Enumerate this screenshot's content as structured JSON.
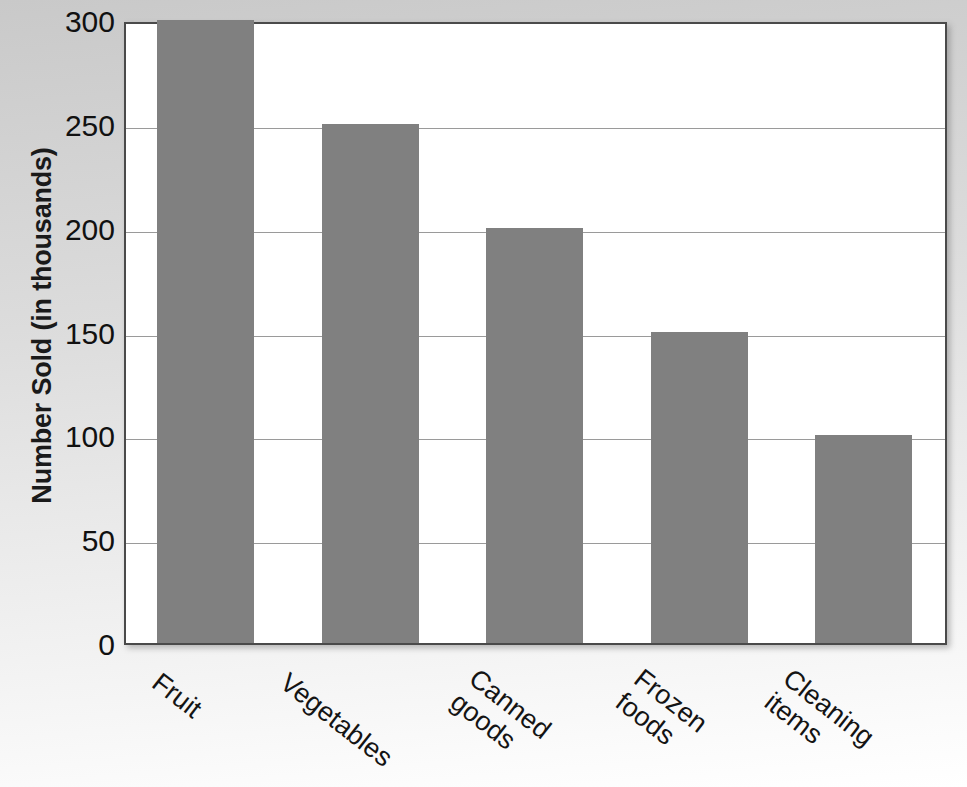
{
  "chart_data": {
    "type": "bar",
    "title": "",
    "xlabel": "",
    "ylabel": "Number Sold (in thousands)",
    "categories": [
      "Fruit",
      "Vegetables",
      "Canned goods",
      "Frozen foods",
      "Cleaning items"
    ],
    "values": [
      300,
      250,
      200,
      150,
      100
    ],
    "ylim": [
      0,
      300
    ],
    "yticks": [
      300,
      250,
      200,
      150,
      100,
      50,
      0
    ],
    "ytick_labels": [
      "300",
      "250",
      "200",
      "150",
      "100",
      "50",
      "0"
    ],
    "grid": true,
    "legend": false,
    "legend_position": "none",
    "bar_color": "#808080",
    "plot_background": "#ffffff",
    "axis_color": "#4a4a4a",
    "gridline_color": "#9a9a9a",
    "page_background": "#dcdcdc",
    "text_color": "#111111",
    "xtick_rotation": 38,
    "series": [
      {
        "name": "Number Sold",
        "values": [
          300,
          250,
          200,
          150,
          100
        ]
      }
    ],
    "points": [
      {
        "category": "Fruit",
        "value": 300
      },
      {
        "category": "Vegetables",
        "value": 250
      },
      {
        "category": "Canned goods",
        "value": 200
      },
      {
        "category": "Frozen foods",
        "value": 150
      },
      {
        "category": "Cleaning items",
        "value": 100
      }
    ]
  }
}
